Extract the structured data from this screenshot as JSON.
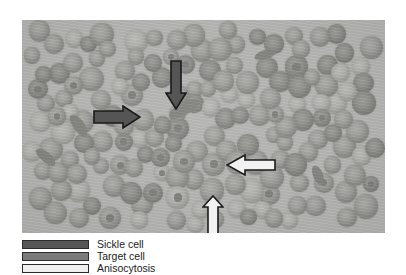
{
  "figure": {
    "type": "micrograph",
    "background_color": "#b6b6b4",
    "frame": {
      "x": 22,
      "y": 20,
      "width": 363,
      "height": 213
    }
  },
  "annotations": {
    "arrows": [
      {
        "id": "sickle-cell-arrow",
        "name": "sickle-cell-arrow",
        "direction": "right",
        "fill_color": "#555555",
        "outline_color": "#1a1a1a",
        "x": 93,
        "y": 105,
        "width": 48,
        "height": 24,
        "points_to": "Sickle cell"
      },
      {
        "id": "target-cell-arrow",
        "name": "target-cell-arrow",
        "direction": "down",
        "fill_color": "#555555",
        "outline_color": "#1a1a1a",
        "x": 165,
        "y": 60,
        "width": 22,
        "height": 50,
        "points_to": "Target cell"
      },
      {
        "id": "anisocytosis-arrow-left",
        "name": "anisocytosis-arrow-left",
        "direction": "left",
        "fill_color": "#f2f2f2",
        "outline_color": "#1a1a1a",
        "x": 226,
        "y": 154,
        "width": 50,
        "height": 22,
        "points_to": "Anisocytosis"
      },
      {
        "id": "anisocytosis-arrow-up",
        "name": "anisocytosis-arrow-up",
        "direction": "up",
        "fill_color": "#f2f2f2",
        "outline_color": "#1a1a1a",
        "x": 202,
        "y": 195,
        "width": 22,
        "height": 42,
        "points_to": "Anisocytosis"
      }
    ]
  },
  "legend": {
    "items": [
      {
        "label": "Sickle cell",
        "swatch_color": "#555555",
        "border_color": "#2b2b2b"
      },
      {
        "label": "Target cell",
        "swatch_color": "#7a7a7a",
        "border_color": "#2b2b2b"
      },
      {
        "label": "Anisocytosis",
        "swatch_color": "#f0f0f0",
        "border_color": "#2b2b2b"
      }
    ]
  },
  "cells": {
    "note": "Red blood cells rendered as gray discs with pale centers",
    "normal_color": "#8b8b88",
    "pale_color": "#bebebb",
    "dark_color": "#7c7c79"
  }
}
